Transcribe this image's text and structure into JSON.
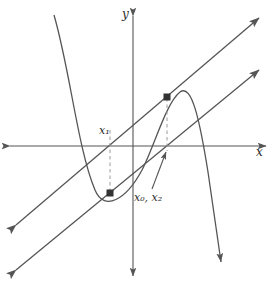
{
  "figure": {
    "name": "newton-method-geometry",
    "background_color": "#ffffff",
    "stroke_color": "#555555",
    "dash_color": "#8c8c8c",
    "point_color": "#333333",
    "width": 276,
    "height": 288
  },
  "axes": {
    "x_label": "x",
    "y_label": "y",
    "origin_x": 133,
    "origin_y": 146,
    "x_axis": {
      "name": "x-axis",
      "x1": 8,
      "y1": 146,
      "x2": 268,
      "y2": 146
    },
    "y_axis": {
      "name": "y-axis",
      "x1": 133,
      "y1": 14,
      "x2": 133,
      "y2": 278
    }
  },
  "labels": {
    "x1": "x₁",
    "x0x2": "x₀, x₂",
    "x1_parts": {
      "base": "x",
      "sub": "1"
    },
    "x0x2_parts": {
      "base1": "x",
      "sub1": "0",
      "sep": ", ",
      "base2": "x",
      "sub2": "2"
    }
  },
  "curve": {
    "name": "cubic-curve",
    "path": "M 54,15 C 70,70 78,150 95,190 C 104,210 124,200 140,172 C 152,150 165,103 180,92 C 192,84 200,120 208,170 C 214,212 219,248 222,268"
  },
  "lines": [
    {
      "name": "tangent-line-upper",
      "x1": 13,
      "y1": 228,
      "x2": 262,
      "y2": 15,
      "arrow_start": true,
      "arrow_end": true
    },
    {
      "name": "tangent-line-lower",
      "x1": 13,
      "y1": 273,
      "x2": 262,
      "y2": 67,
      "arrow_start": true,
      "arrow_end": true
    }
  ],
  "dashed_drops": [
    {
      "name": "dash-x1",
      "x1": 110,
      "y1": 193,
      "x2": 110,
      "y2": 128
    },
    {
      "name": "dash-x0x2",
      "x1": 167,
      "y1": 97,
      "x2": 167,
      "y2": 150
    }
  ],
  "points": [
    {
      "name": "point-lower-intersection",
      "x": 110,
      "y": 193
    },
    {
      "name": "point-upper-intersection",
      "x": 167,
      "y": 97
    }
  ],
  "pointer": {
    "name": "x0x2-pointer-arrow",
    "x1": 152,
    "y1": 190,
    "x2": 166,
    "y2": 150
  }
}
